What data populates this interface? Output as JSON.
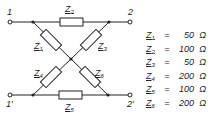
{
  "diagram": {
    "type": "lattice (X) two-port network",
    "terminals": {
      "top_left": "1",
      "top_right": "2",
      "bottom_left": "1'",
      "bottom_right": "2'"
    },
    "impedance_labels": {
      "z1": {
        "name": "Z",
        "sub": "1"
      },
      "z2": {
        "name": "Z",
        "sub": "2"
      },
      "z3": {
        "name": "Z",
        "sub": "3"
      },
      "z4": {
        "name": "Z",
        "sub": "4"
      },
      "z5": {
        "name": "Z",
        "sub": "5"
      },
      "z6": {
        "name": "Z",
        "sub": "6"
      }
    },
    "values": [
      {
        "name": "Z",
        "sub": "1",
        "eq": "=",
        "value": "50",
        "unit": "Ω"
      },
      {
        "name": "Z",
        "sub": "2",
        "eq": "=",
        "value": "100",
        "unit": "Ω"
      },
      {
        "name": "Z",
        "sub": "3",
        "eq": "=",
        "value": "50",
        "unit": "Ω"
      },
      {
        "name": "Z",
        "sub": "4",
        "eq": "=",
        "value": "200",
        "unit": "Ω"
      },
      {
        "name": "Z",
        "sub": "5",
        "eq": "=",
        "value": "100",
        "unit": "Ω"
      },
      {
        "name": "Z",
        "sub": "6",
        "eq": "=",
        "value": "200",
        "unit": "Ω"
      }
    ],
    "colors": {
      "line": "#222222",
      "background": "#ffffff"
    }
  }
}
